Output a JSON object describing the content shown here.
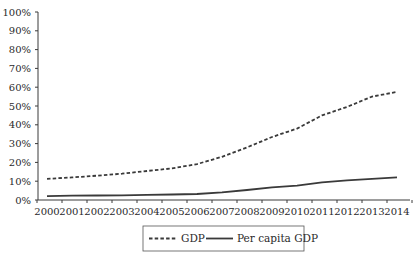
{
  "chart_data": {
    "type": "line",
    "title": "",
    "xlabel": "",
    "ylabel": "",
    "categories": [
      "2000",
      "2001",
      "2002",
      "2003",
      "2004",
      "2005",
      "2006",
      "2007",
      "2008",
      "2009",
      "2010",
      "2011",
      "2012",
      "2013",
      "2014"
    ],
    "series": [
      {
        "name": "GDP",
        "style": "dashed",
        "values": [
          11.2,
          12.0,
          12.9,
          14.0,
          15.4,
          16.8,
          19.1,
          23.0,
          28.0,
          33.5,
          38.0,
          45.0,
          49.5,
          55.0,
          57.5
        ]
      },
      {
        "name": "Per capita GDP",
        "style": "solid",
        "values": [
          2.1,
          2.3,
          2.4,
          2.5,
          2.7,
          2.9,
          3.2,
          4.1,
          5.3,
          6.7,
          7.6,
          9.4,
          10.5,
          11.3,
          12.0
        ]
      }
    ],
    "ylim": [
      0,
      100
    ],
    "yticks": [
      "0%",
      "10%",
      "20%",
      "30%",
      "40%",
      "50%",
      "60%",
      "70%",
      "80%",
      "90%",
      "100%"
    ],
    "grid": false,
    "legend_position": "bottom"
  },
  "legend": {
    "items": [
      {
        "label": "GDP",
        "style": "dashed"
      },
      {
        "label": "Per capita GDP",
        "style": "solid"
      }
    ]
  },
  "colors": {
    "line": "#3a3a3a",
    "text": "#2a2a2a",
    "background": "#ffffff"
  }
}
